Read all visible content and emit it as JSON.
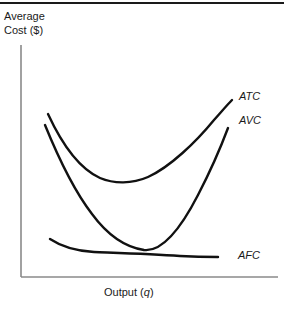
{
  "figure": {
    "title": "",
    "y_axis_label_line1": "Average",
    "y_axis_label_line2": "Cost ($)",
    "x_axis_label": "Output (q)",
    "curve_labels": {
      "atc": "ATC",
      "avc": "AVC",
      "afc": "AFC"
    },
    "colors": {
      "curve": "#111111",
      "axis": "#8a8a8a",
      "rule": "#1a1a1a",
      "text": "#1a1a1a",
      "background": "#ffffff"
    }
  },
  "chart_data": {
    "type": "line",
    "xlabel": "Output (q)",
    "ylabel": "Average Cost ($)",
    "xlim": [
      0,
      100
    ],
    "ylim": [
      0,
      100
    ],
    "grid": false,
    "legend": "inline-right-end-labels",
    "axis_ticks": {
      "x": [],
      "y": []
    },
    "annotations": [
      "AVC and AFC intersect at approximately (47, 17)",
      "ATC minimum at approximately (38, 42)",
      "AVC minimum at approximately (29, 12)",
      "AFC is monotonically decreasing"
    ],
    "series": [
      {
        "name": "ATC",
        "label": "ATC",
        "description": "U-shaped average total cost curve",
        "points": [
          {
            "x": 10.5,
            "y": 71
          },
          {
            "x": 16,
            "y": 59
          },
          {
            "x": 22,
            "y": 51
          },
          {
            "x": 29,
            "y": 45
          },
          {
            "x": 38,
            "y": 42
          },
          {
            "x": 48,
            "y": 44
          },
          {
            "x": 58,
            "y": 49
          },
          {
            "x": 68,
            "y": 57
          },
          {
            "x": 78,
            "y": 66
          },
          {
            "x": 82,
            "y": 76
          }
        ]
      },
      {
        "name": "AVC",
        "label": "AVC",
        "description": "U-shaped average variable cost curve, below ATC, rising steeply at right",
        "points": [
          {
            "x": 9.5,
            "y": 66
          },
          {
            "x": 14,
            "y": 52
          },
          {
            "x": 20,
            "y": 38
          },
          {
            "x": 26,
            "y": 25
          },
          {
            "x": 31,
            "y": 17
          },
          {
            "x": 38,
            "y": 14
          },
          {
            "x": 47,
            "y": 17
          },
          {
            "x": 56,
            "y": 27
          },
          {
            "x": 66,
            "y": 40
          },
          {
            "x": 74,
            "y": 52
          },
          {
            "x": 80,
            "y": 64
          }
        ]
      },
      {
        "name": "AFC",
        "label": "AFC",
        "description": "Monotonically declining average fixed cost curve",
        "points": [
          {
            "x": 11,
            "y": 20
          },
          {
            "x": 18,
            "y": 17
          },
          {
            "x": 27,
            "y": 16
          },
          {
            "x": 38,
            "y": 15
          },
          {
            "x": 47,
            "y": 14
          },
          {
            "x": 57,
            "y": 13
          },
          {
            "x": 67,
            "y": 11
          },
          {
            "x": 77,
            "y": 10
          }
        ]
      }
    ]
  }
}
